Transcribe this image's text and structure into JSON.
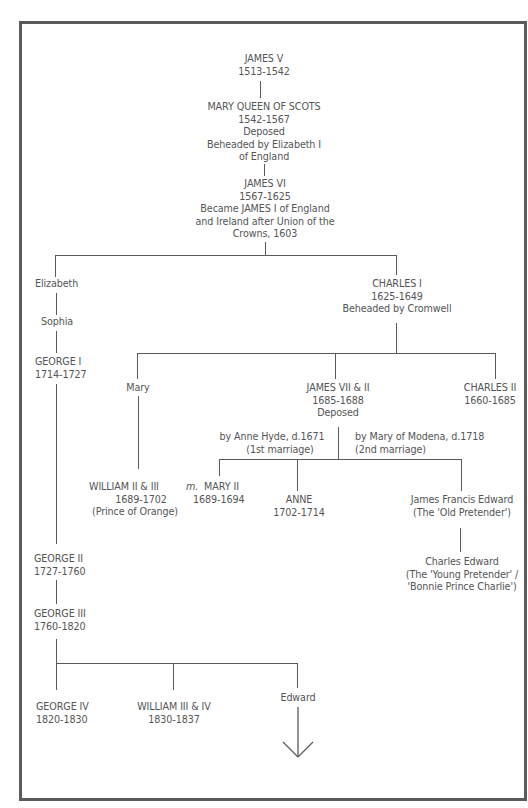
{
  "diagram": {
    "type": "family-tree",
    "nodes": {
      "james_v": {
        "name": "JAMES V",
        "lines": [
          "1513-1542"
        ]
      },
      "mary_qos": {
        "name": "MARY QUEEN OF SCOTS",
        "lines": [
          "1542-1567",
          "Deposed",
          "Beheaded by Elizabeth I",
          "of England"
        ]
      },
      "james_vi": {
        "name": "JAMES VI",
        "lines": [
          "1567-1625",
          "Became JAMES I of England",
          "and Ireland after Union of the",
          "Crowns, 1603"
        ]
      },
      "elizabeth": {
        "name": "Elizabeth"
      },
      "sophia": {
        "name": "Sophia"
      },
      "george_i": {
        "name": "GEORGE I",
        "lines": [
          "1714-1727"
        ]
      },
      "charles_i": {
        "name": "CHARLES I",
        "lines": [
          "1625-1649",
          "Beheaded by Cromwell"
        ]
      },
      "mary": {
        "name": "Mary"
      },
      "james_vii": {
        "name": "JAMES VII & II",
        "lines": [
          "1685-1688",
          "Deposed"
        ]
      },
      "charles_ii": {
        "name": "CHARLES II",
        "lines": [
          "1660-1685"
        ]
      },
      "first_marriage": {
        "lines": [
          "by Anne Hyde, d.1671",
          "(1st marriage)"
        ]
      },
      "second_marriage": {
        "lines": [
          "by Mary of Modena, d.1718",
          "(2nd marriage)"
        ]
      },
      "william_ii_iii": {
        "name": "WILLIAM II &  III",
        "lines": [
          "1689-1702",
          "(Prince of Orange)"
        ]
      },
      "mary_ii": {
        "prefix": "m.",
        "name": "MARY II",
        "lines": [
          "1689-1694"
        ]
      },
      "anne": {
        "name": "ANNE",
        "lines": [
          "1702-1714"
        ]
      },
      "james_francis_edward": {
        "name": "James Francis Edward",
        "lines": [
          "(The 'Old Pretender')"
        ]
      },
      "charles_edward": {
        "name": "Charles Edward",
        "lines": [
          "(The 'Young Pretender' /",
          "'Bonnie Prince Charlie')"
        ]
      },
      "george_ii": {
        "name": "GEORGE II",
        "lines": [
          "1727-1760"
        ]
      },
      "george_iii": {
        "name": "GEORGE III",
        "lines": [
          "1760-1820"
        ]
      },
      "george_iv": {
        "name": "GEORGE IV",
        "lines": [
          "1820-1830"
        ]
      },
      "william_iii_iv": {
        "name": "WILLIAM III & IV",
        "lines": [
          "1830-1837"
        ]
      },
      "edward": {
        "name": "Edward"
      }
    },
    "icons": {
      "continuation": "down-arrow-icon"
    },
    "colors": {
      "line": "#5a5a5a",
      "text": "#555555",
      "frame": "#5b5b5b",
      "background": "#ffffff"
    }
  }
}
